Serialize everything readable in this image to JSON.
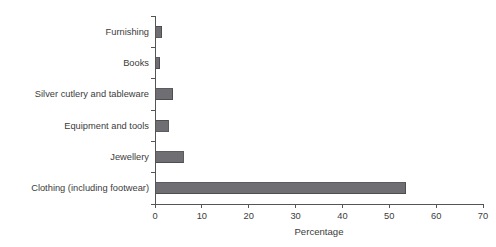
{
  "chart_data": {
    "type": "bar",
    "orientation": "horizontal",
    "title": "",
    "xlabel": "Percentage",
    "ylabel": "",
    "xlim": [
      0,
      70
    ],
    "xticks": [
      0,
      10,
      20,
      30,
      40,
      50,
      60,
      70
    ],
    "xtick_labels": [
      "0",
      "10",
      "20",
      "30",
      "40",
      "50",
      "60",
      "70"
    ],
    "grid": false,
    "legend": false,
    "categories": [
      "Furnishing",
      "Books",
      "Silver cutlery and tableware",
      "Equipment and tools",
      "Jewellery",
      "Clothing (including footwear)"
    ],
    "values": [
      1.4,
      1.0,
      3.8,
      2.8,
      6.0,
      53.5
    ],
    "bar_color": "#6e6e73",
    "bar_edge_color": "#4a4a4f",
    "axis_color": "#555555",
    "text_color": "#3c3c3c",
    "background": "#ffffff"
  }
}
